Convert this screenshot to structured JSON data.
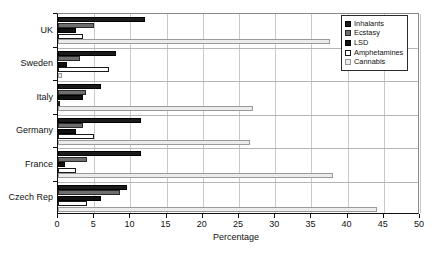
{
  "chart_data": {
    "type": "bar",
    "orientation": "horizontal",
    "title": "",
    "xlabel": "Percentage",
    "ylabel": "",
    "xlim": [
      0,
      50
    ],
    "xticks": [
      0,
      5,
      10,
      15,
      20,
      25,
      30,
      35,
      40,
      45,
      50
    ],
    "grid": true,
    "legend_position": "top-right",
    "categories": [
      "UK",
      "Sweden",
      "Italy",
      "Germany",
      "France",
      "Czech Rep"
    ],
    "series": [
      {
        "name": "Inhalants",
        "color": "#1b1b1b",
        "values": [
          12.0,
          8.0,
          6.0,
          11.5,
          11.5,
          9.5
        ]
      },
      {
        "name": "Ecstasy",
        "color": "#6e6e6e",
        "values": [
          5.0,
          3.0,
          3.8,
          3.5,
          4.0,
          8.5
        ]
      },
      {
        "name": "LSD",
        "color": "#111111",
        "values": [
          2.5,
          1.3,
          3.5,
          2.5,
          1.0,
          6.0
        ]
      },
      {
        "name": "Amphetamines",
        "color": "#ffffff",
        "values": [
          3.5,
          7.0,
          0.3,
          5.0,
          2.5,
          4.0
        ]
      },
      {
        "name": "Cannabis",
        "color": "#ececec",
        "values": [
          37.5,
          0.5,
          27.0,
          26.5,
          38.0,
          44.0
        ]
      }
    ]
  },
  "legend": {
    "items": [
      {
        "label": "Inhalants"
      },
      {
        "label": "Ecstasy"
      },
      {
        "label": "LSD"
      },
      {
        "label": "Amphetamines"
      },
      {
        "label": "Cannabis"
      }
    ]
  },
  "axis": {
    "x_title": "Percentage",
    "x_tick_labels": [
      "0",
      "5",
      "10",
      "15",
      "20",
      "25",
      "30",
      "35",
      "40",
      "45",
      "50"
    ],
    "y_tick_labels": [
      "UK",
      "Sweden",
      "Italy",
      "Germany",
      "France",
      "Czech Rep"
    ]
  },
  "caption": {
    "text": ""
  }
}
